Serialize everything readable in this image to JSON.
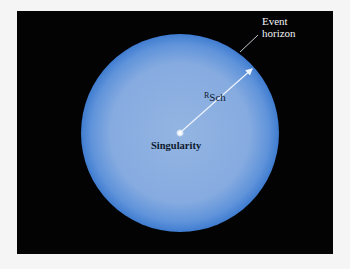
{
  "diagram": {
    "labels": {
      "event_line1": "Event",
      "event_line2": "horizon",
      "radius_main": "R",
      "radius_sub": "Sch",
      "singularity": "Singularity"
    },
    "colors": {
      "background": "#030304",
      "sphere_center": "#8db0e0",
      "sphere_edge": "#3f7cd0",
      "arrow": "#eef4ff",
      "text_dark": "#0e1a2e",
      "text_light": "#f2f4f8"
    },
    "geometry": {
      "sphere_center": [
        180,
        133
      ],
      "sphere_radius": 99,
      "singularity": [
        180,
        133
      ],
      "arrow_tip": [
        253,
        68
      ]
    }
  }
}
